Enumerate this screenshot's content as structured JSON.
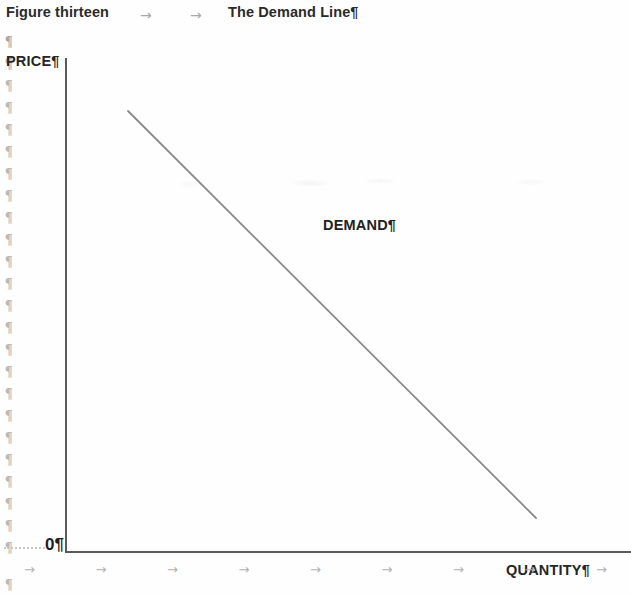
{
  "document": {
    "heading_left": "Figure thirteen",
    "heading_right": "The Demand Line¶",
    "heading_tab_arrows": [
      "→",
      "→"
    ]
  },
  "formatting_marks": {
    "pilcrow": "¶",
    "tab_arrow": "→",
    "margin_pilcrow_count": 24,
    "bottom_tab_arrow_count": 9
  },
  "chart_data": {
    "type": "line",
    "title": "The Demand Line",
    "figure_number": "Figure thirteen",
    "xlabel": "QUANTITY¶",
    "ylabel": "PRICE¶",
    "origin_label": "0¶",
    "series": [
      {
        "name": "DEMAND¶",
        "points": [
          [
            128,
            111
          ],
          [
            536,
            518
          ]
        ],
        "description": "downward-sloping straight demand curve",
        "color": "#8a8a8a"
      }
    ],
    "annotations": [
      {
        "text": "DEMAND¶",
        "x": 323,
        "y": 217
      }
    ],
    "axes": {
      "y_axis": {
        "x": 65,
        "y_top": 58,
        "y_bottom": 552,
        "color": "#5a5a5a"
      },
      "x_axis": {
        "y": 551,
        "x_left": 65,
        "x_right": 631,
        "color": "#5a5a5a"
      },
      "ticks": false,
      "grid": false
    },
    "legend": null
  },
  "labels": {
    "price": "PRICE¶",
    "quantity": "QUANTITY¶",
    "zero": "0¶",
    "demand": "DEMAND¶"
  },
  "colors": {
    "axis": "#5a5a5a",
    "demand_line": "#8a8a8a",
    "text": "#262626",
    "formatting_mark": "#b9b9b9",
    "page_background": "#fefefe"
  }
}
